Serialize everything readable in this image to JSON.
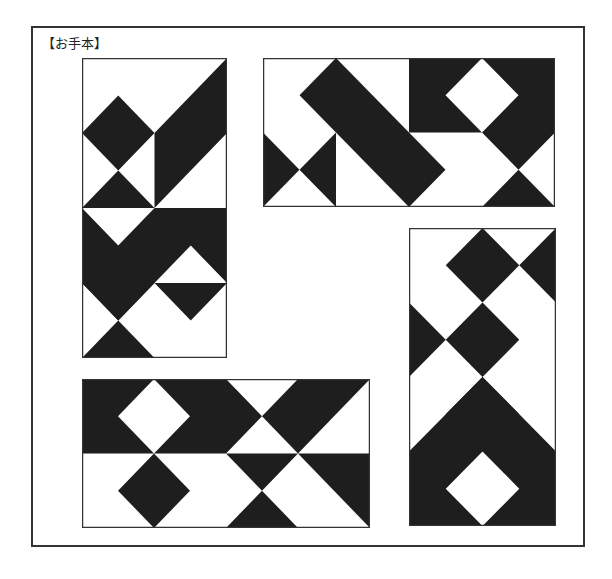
{
  "label": "【お手本】",
  "colors": {
    "fill": "#1e1e1e",
    "background": "#ffffff",
    "stroke": "#333333"
  },
  "panels": [
    {
      "name": "panel-top-left",
      "cols": 2,
      "rows": 4,
      "box": {
        "left": 82,
        "top": 58,
        "width": 145,
        "height": 300
      },
      "black": [
        [
          [
            0.5,
            0.5
          ],
          [
            1,
            1
          ],
          [
            0.5,
            1.5
          ],
          [
            0,
            1
          ]
        ],
        [
          [
            0,
            2
          ],
          [
            1,
            2
          ],
          [
            0.5,
            1.5
          ]
        ],
        [
          [
            1,
            1
          ],
          [
            2,
            0
          ],
          [
            2,
            1
          ],
          [
            1,
            2
          ]
        ],
        [
          [
            0,
            2
          ],
          [
            0.5,
            2.5
          ],
          [
            1,
            2
          ],
          [
            2,
            2
          ],
          [
            2,
            2.5
          ],
          [
            2,
            3
          ],
          [
            1.5,
            2.5
          ],
          [
            1,
            3
          ],
          [
            0.5,
            3.5
          ],
          [
            0,
            3
          ]
        ],
        [
          [
            1,
            3
          ],
          [
            2,
            3
          ],
          [
            1.5,
            3.5
          ]
        ],
        [
          [
            1,
            3
          ],
          [
            0.5,
            3.5
          ],
          [
            0,
            3
          ]
        ],
        [
          [
            0,
            4
          ],
          [
            1,
            4
          ],
          [
            0.5,
            3.5
          ]
        ]
      ]
    },
    {
      "name": "panel-top-right",
      "cols": 4,
      "rows": 2,
      "box": {
        "left": 263,
        "top": 58,
        "width": 292,
        "height": 149
      },
      "black": [
        [
          [
            0.5,
            0.5
          ],
          [
            1,
            0
          ],
          [
            2.5,
            1.5
          ],
          [
            2,
            2
          ]
        ],
        [
          [
            2,
            0
          ],
          [
            3,
            0
          ],
          [
            2.5,
            0.5
          ],
          [
            3,
            1
          ],
          [
            2,
            1
          ]
        ],
        [
          [
            3,
            0
          ],
          [
            4,
            0
          ],
          [
            4,
            1
          ],
          [
            3.5,
            1.5
          ],
          [
            3,
            1
          ],
          [
            3.5,
            0.5
          ]
        ],
        [
          [
            0,
            1
          ],
          [
            0.5,
            1.5
          ],
          [
            0,
            2
          ]
        ],
        [
          [
            0.5,
            1.5
          ],
          [
            1,
            1
          ],
          [
            1,
            2
          ]
        ],
        [
          [
            3,
            2
          ],
          [
            4,
            2
          ],
          [
            3.5,
            1.5
          ]
        ]
      ]
    },
    {
      "name": "panel-right-tall",
      "cols": 2,
      "rows": 4,
      "box": {
        "left": 409,
        "top": 228,
        "width": 147,
        "height": 298
      },
      "black": [
        [
          [
            1,
            0
          ],
          [
            1.5,
            0.5
          ],
          [
            1,
            1
          ],
          [
            0.5,
            0.5
          ]
        ],
        [
          [
            2,
            0
          ],
          [
            2,
            1
          ],
          [
            1.5,
            0.5
          ]
        ],
        [
          [
            1,
            1
          ],
          [
            1.5,
            1.5
          ],
          [
            1,
            2
          ],
          [
            0.5,
            1.5
          ]
        ],
        [
          [
            0,
            1
          ],
          [
            0.5,
            1.5
          ],
          [
            0,
            2
          ]
        ],
        [
          [
            1,
            2
          ],
          [
            1.5,
            2.5
          ],
          [
            1,
            3
          ],
          [
            0.5,
            2.5
          ]
        ],
        [
          [
            0,
            3
          ],
          [
            1,
            2
          ],
          [
            2,
            3
          ],
          [
            2,
            4
          ],
          [
            1,
            4
          ],
          [
            1.5,
            3.5
          ],
          [
            1,
            3
          ],
          [
            0.5,
            3.5
          ],
          [
            1,
            4
          ],
          [
            0,
            4
          ]
        ]
      ]
    },
    {
      "name": "panel-bottom",
      "cols": 4,
      "rows": 2,
      "box": {
        "left": 82,
        "top": 379,
        "width": 288,
        "height": 149
      },
      "black": [
        [
          [
            0,
            0
          ],
          [
            1,
            0
          ],
          [
            0.5,
            0.5
          ],
          [
            1,
            1
          ],
          [
            1.5,
            0.5
          ],
          [
            1,
            0
          ],
          [
            2,
            0
          ],
          [
            2.5,
            0.5
          ],
          [
            2,
            1
          ],
          [
            0,
            1
          ]
        ],
        [
          [
            2.5,
            0.5
          ],
          [
            3,
            0
          ],
          [
            4,
            0
          ],
          [
            3,
            1
          ]
        ],
        [
          [
            1,
            1
          ],
          [
            1.5,
            1.5
          ],
          [
            1,
            2
          ],
          [
            0.5,
            1.5
          ]
        ],
        [
          [
            2,
            1
          ],
          [
            3,
            1
          ],
          [
            2.5,
            1.5
          ]
        ],
        [
          [
            3,
            1
          ],
          [
            4,
            1
          ],
          [
            4,
            2
          ]
        ],
        [
          [
            2,
            2
          ],
          [
            3,
            2
          ],
          [
            2.5,
            1.5
          ]
        ]
      ]
    }
  ]
}
